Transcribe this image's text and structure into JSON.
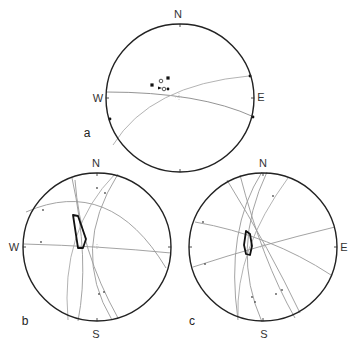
{
  "figure": {
    "panels": [
      {
        "id": "a",
        "label": "a",
        "center": [
          180,
          98
        ],
        "radius": 74,
        "directions": {
          "N": "N",
          "W": "W",
          "E": "E"
        },
        "great_circles": [
          {
            "d": "M106,92 Q200,92 254,117",
            "color": "#888"
          },
          {
            "d": "M113,145 Q150,85 249,76",
            "color": "#aaa"
          }
        ],
        "markers": [
          {
            "type": "filled-square",
            "x": 168,
            "y": 78
          },
          {
            "type": "filled-square",
            "x": 152,
            "y": 85
          },
          {
            "type": "open-circle",
            "x": 161,
            "y": 81
          },
          {
            "type": "triangle",
            "x": 160,
            "y": 88
          },
          {
            "type": "open-circle",
            "x": 164,
            "y": 89
          },
          {
            "type": "filled-dot",
            "x": 168,
            "y": 89
          },
          {
            "type": "filled-dot",
            "x": 250,
            "y": 76
          },
          {
            "type": "filled-dot",
            "x": 253,
            "y": 117
          },
          {
            "type": "filled-dot",
            "x": 110,
            "y": 119
          },
          {
            "type": "dotted-cross",
            "x": 179,
            "y": 97
          }
        ]
      },
      {
        "id": "b",
        "label": "b",
        "center": [
          97,
          247
        ],
        "radius": 74,
        "directions": {
          "N": "N",
          "W": "W",
          "S": "S"
        },
        "great_circles": [
          {
            "d": "M26,212 Q110,175 166,268",
            "color": "#999"
          },
          {
            "d": "M24,244 Q100,246 171,253",
            "color": "#999"
          },
          {
            "d": "M72,178 Q90,260 78,321",
            "color": "#999"
          },
          {
            "d": "M115,174 Q60,230 68,320",
            "color": "#aaa"
          },
          {
            "d": "M118,174 Q70,250 112,320",
            "color": "#999"
          },
          {
            "d": "M75,180 Q80,250 118,318",
            "color": "#999"
          }
        ],
        "polygon": "73,215 78,216 86,239 83,248 78,248",
        "ticks": [
          {
            "x": 43,
            "y": 210
          },
          {
            "x": 41,
            "y": 242
          },
          {
            "x": 97,
            "y": 188
          },
          {
            "x": 105,
            "y": 193
          },
          {
            "x": 99,
            "y": 294
          },
          {
            "x": 104,
            "y": 292
          }
        ],
        "cross": [
          97,
          247
        ]
      },
      {
        "id": "c",
        "label": "c",
        "center": [
          263,
          247
        ],
        "radius": 74,
        "directions": {
          "N": "N",
          "E": "E",
          "S": "S"
        },
        "great_circles": [
          {
            "d": "M195,222 Q270,235 331,275",
            "color": "#999"
          },
          {
            "d": "M193,267 Q260,245 335,227",
            "color": "#999"
          },
          {
            "d": "M227,180 Q270,250 300,313",
            "color": "#999"
          },
          {
            "d": "M262,172 Q225,230 238,320",
            "color": "#999"
          },
          {
            "d": "M267,172 Q230,250 262,322",
            "color": "#999"
          },
          {
            "d": "M288,178 Q235,250 238,318",
            "color": "#aaa"
          },
          {
            "d": "M240,175 Q262,260 295,318",
            "color": "#999"
          }
        ],
        "polygon": "246,231 250,234 252,246 250,255 246,254 244,245",
        "ticks": [
          {
            "x": 203,
            "y": 222
          },
          {
            "x": 205,
            "y": 264
          },
          {
            "x": 273,
            "y": 196
          },
          {
            "x": 252,
            "y": 297
          },
          {
            "x": 255,
            "y": 302
          },
          {
            "x": 276,
            "y": 294
          },
          {
            "x": 282,
            "y": 290
          }
        ],
        "cross": [
          263,
          247
        ]
      }
    ],
    "label_positions": {
      "a": {
        "N": [
          178,
          14
        ],
        "W": [
          98,
          98
        ],
        "E": [
          261,
          97
        ],
        "panel": [
          87,
          133
        ]
      },
      "b": {
        "N": [
          96,
          163
        ],
        "W": [
          14,
          247
        ],
        "S": [
          96,
          334
        ],
        "panel": [
          25,
          321
        ]
      },
      "c": {
        "N": [
          263,
          163
        ],
        "E": [
          344,
          247
        ],
        "S": [
          264,
          334
        ],
        "panel": [
          192,
          321
        ]
      }
    }
  }
}
